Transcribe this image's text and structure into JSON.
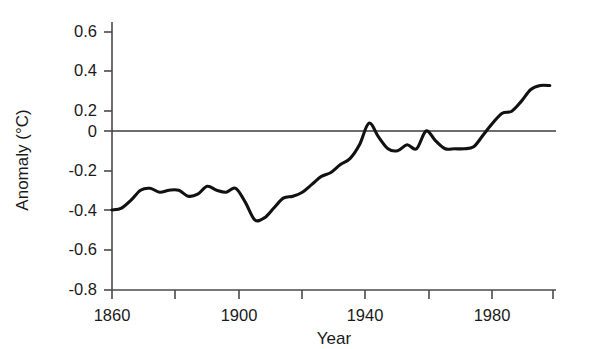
{
  "chart_data": {
    "type": "line",
    "title": "",
    "xlabel": "Year",
    "ylabel": "Anomaly (°C)",
    "xlim": [
      1860,
      1999
    ],
    "ylim": [
      -0.8,
      0.7
    ],
    "grid": false,
    "legend": "none",
    "x_ticks_major": [
      1860,
      1900,
      1940,
      1980
    ],
    "x_tick_labels": [
      "1860",
      "1900",
      "1940",
      "1980"
    ],
    "x_ticks_minor": [
      1880,
      1920,
      1960,
      1999
    ],
    "y_ticks": [
      0.6,
      0.4,
      0.2,
      0,
      -0.2,
      -0.4,
      -0.6,
      -0.8
    ],
    "y_tick_labels": [
      "0.6",
      "0.4",
      "0.2",
      "0",
      "-0.2",
      "-0.4",
      "-0.6",
      "-0.8"
    ],
    "zero_reference_line": 0,
    "line_color": "#111111",
    "series": [
      {
        "name": "Global temperature anomaly",
        "x": [
          1860,
          1863,
          1866,
          1869,
          1872,
          1875,
          1878,
          1881,
          1884,
          1887,
          1890,
          1893,
          1896,
          1899,
          1902,
          1905,
          1908,
          1911,
          1914,
          1917,
          1920,
          1923,
          1926,
          1929,
          1932,
          1935,
          1938,
          1941,
          1944,
          1947,
          1950,
          1953,
          1956,
          1959,
          1962,
          1965,
          1968,
          1971,
          1974,
          1977,
          1980,
          1983,
          1986,
          1989,
          1992,
          1995,
          1998
        ],
        "y": [
          -0.4,
          -0.39,
          -0.35,
          -0.3,
          -0.29,
          -0.31,
          -0.3,
          -0.3,
          -0.33,
          -0.32,
          -0.28,
          -0.3,
          -0.31,
          -0.29,
          -0.36,
          -0.45,
          -0.44,
          -0.39,
          -0.34,
          -0.33,
          -0.31,
          -0.27,
          -0.23,
          -0.21,
          -0.17,
          -0.14,
          -0.07,
          0.04,
          -0.03,
          -0.09,
          -0.1,
          -0.07,
          -0.09,
          0.0,
          -0.05,
          -0.09,
          -0.09,
          -0.09,
          -0.08,
          -0.02,
          0.04,
          0.09,
          0.1,
          0.15,
          0.21,
          0.23,
          0.23
        ]
      }
    ]
  }
}
